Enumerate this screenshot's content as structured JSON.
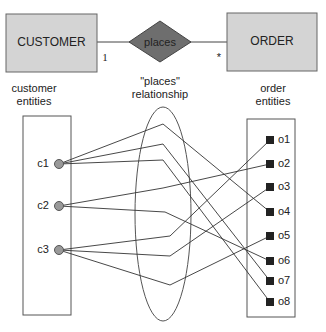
{
  "entities": {
    "customer": {
      "label": "CUSTOMER",
      "cardinality": "1",
      "caption_line1": "customer",
      "caption_line2": "entities"
    },
    "order": {
      "label": "ORDER",
      "cardinality": "*",
      "caption_line1": "order",
      "caption_line2": "entities"
    }
  },
  "relationship": {
    "label": "places",
    "caption_line1": "\"places\"",
    "caption_line2": "relationship"
  },
  "customers": [
    {
      "id": "c1",
      "label": "c1",
      "y": 164
    },
    {
      "id": "c2",
      "label": "c2",
      "y": 206
    },
    {
      "id": "c3",
      "label": "c3",
      "y": 250
    }
  ],
  "orders": [
    {
      "id": "o1",
      "label": "o1",
      "y": 140
    },
    {
      "id": "o2",
      "label": "o2",
      "y": 164
    },
    {
      "id": "o3",
      "label": "o3",
      "y": 187
    },
    {
      "id": "o4",
      "label": "o4",
      "y": 212
    },
    {
      "id": "o5",
      "label": "o5",
      "y": 236
    },
    {
      "id": "o6",
      "label": "o6",
      "y": 261
    },
    {
      "id": "o7",
      "label": "o7",
      "y": 281
    },
    {
      "id": "o8",
      "label": "o8",
      "y": 302
    }
  ],
  "links": [
    {
      "from": "c1",
      "mid": [
        163,
        124
      ],
      "to": "o4"
    },
    {
      "from": "c1",
      "mid": [
        163,
        144
      ],
      "to": "o7"
    },
    {
      "from": "c1",
      "mid": [
        163,
        160
      ],
      "to": "o8"
    },
    {
      "from": "c2",
      "mid": [
        163,
        188
      ],
      "to": "o2"
    },
    {
      "from": "c2",
      "mid": [
        165,
        212
      ],
      "to": "o6"
    },
    {
      "from": "c3",
      "mid": [
        170,
        236
      ],
      "to": "o1"
    },
    {
      "from": "c3",
      "mid": [
        170,
        256
      ],
      "to": "o3"
    },
    {
      "from": "c3",
      "mid": [
        170,
        285
      ],
      "to": "o5"
    }
  ],
  "colors": {
    "entity_fill": "#d4d4d4",
    "diamond_fill": "#6e6e6e",
    "circle_fill": "#999999",
    "square_fill": "#222222",
    "line": "#333333"
  }
}
